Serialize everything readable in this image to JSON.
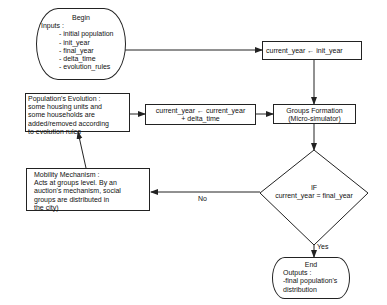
{
  "diagram": {
    "type": "flowchart",
    "nodes": {
      "begin": {
        "title": "Begin",
        "heading": "Inputs :",
        "items": [
          "- initial population",
          "- init_year",
          "- final_year",
          "- delta_time",
          "- evolution_rules"
        ]
      },
      "init_assign": {
        "text": "current_year ← init_year"
      },
      "groups_formation": {
        "line1": "Groups Formation",
        "line2": "(Micro-simulator)"
      },
      "increment": {
        "line1": "current_year ← current_year",
        "line2": "+ delta_time"
      },
      "population_evolution": {
        "lines": [
          "Population's Evolution :",
          "some housing units and",
          "some households  are",
          "added/removed according",
          "to evolution rules"
        ]
      },
      "decision": {
        "line1": "IF",
        "line2": "current_year = final_year"
      },
      "mobility": {
        "lines": [
          "Mobility Mechanism :",
          "Acts at groups level. By an",
          "auction's mechanism, social",
          "groups are distributed in",
          "the city)"
        ]
      },
      "end": {
        "title": "End",
        "lines": [
          "Outputs :",
          "-final population's",
          "distribution"
        ]
      }
    },
    "edge_labels": {
      "no": "No",
      "yes": "Yes"
    },
    "edges": [
      [
        "begin",
        "init_assign"
      ],
      [
        "init_assign",
        "groups_formation"
      ],
      [
        "groups_formation",
        "decision"
      ],
      [
        "decision",
        "mobility",
        "No"
      ],
      [
        "decision",
        "end",
        "Yes"
      ],
      [
        "mobility",
        "population_evolution"
      ],
      [
        "population_evolution",
        "increment"
      ],
      [
        "increment",
        "groups_formation"
      ]
    ],
    "colors": {
      "stroke": "#222222",
      "background": "#ffffff",
      "text": "#111111"
    }
  }
}
